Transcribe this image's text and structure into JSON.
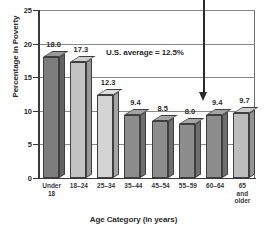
{
  "chart_data": {
    "type": "bar",
    "title": "",
    "xlabel": "Age Category (in years)",
    "ylabel": "Percentage in Poverty",
    "categories": [
      "Under\n18",
      "18–24",
      "25–34",
      "35–44",
      "45–54",
      "55–59",
      "60–64",
      "65\nand\nolder"
    ],
    "values": [
      18.0,
      17.3,
      12.3,
      9.4,
      8.5,
      8.0,
      9.4,
      9.7
    ],
    "value_labels": [
      "18.0",
      "17.3",
      "12.3",
      "9.4",
      "8.5",
      "8.0",
      "9.4",
      "9.7"
    ],
    "ylim": [
      0,
      25
    ],
    "yticks": [
      0,
      5,
      10,
      15,
      20,
      25
    ],
    "ytick_labels": [
      "0",
      "5",
      "10",
      "15",
      "20",
      "25"
    ],
    "grid": true,
    "legend": false,
    "annotations": [
      {
        "text": "U.S. average = 12.5%",
        "value": 12.5
      },
      {
        "text": "",
        "type": "arrow",
        "points_to": "60–64"
      }
    ],
    "bar_colors": [
      "#7d7d7d",
      "#c3c3c3",
      "#d4d4d4",
      "#8d8d8d",
      "#8d8d8d",
      "#8d8d8d",
      "#8d8d8d",
      "#bdbdbd"
    ]
  },
  "axis": {
    "y_title": "Percentage in Poverty",
    "x_title": "Age Category (in years)"
  },
  "annotation": {
    "us_average": "U.S. average = 12.5%"
  }
}
